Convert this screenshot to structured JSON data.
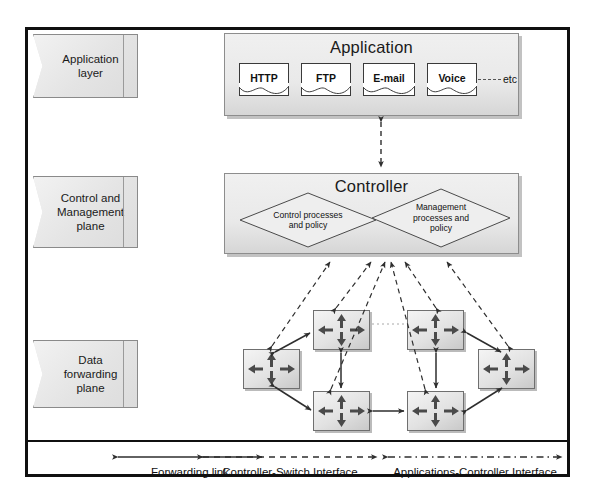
{
  "diagram": {
    "type": "layered-network-architecture"
  },
  "layers": [
    {
      "id": "application-layer",
      "label": "Application\nlayer"
    },
    {
      "id": "control-management-plane",
      "label": "Control and\nManagement\nplane"
    },
    {
      "id": "data-forwarding-plane",
      "label": "Data\nforwarding\nplane"
    }
  ],
  "application_panel": {
    "title": "Application",
    "items": [
      {
        "label": "HTTP"
      },
      {
        "label": "FTP"
      },
      {
        "label": "E-mail"
      },
      {
        "label": "Voice"
      }
    ],
    "etc_label": "etc"
  },
  "controller_panel": {
    "title": "Controller",
    "processes": [
      {
        "id": "control-processes",
        "label": "Control processes\nand policy"
      },
      {
        "id": "management-processes",
        "label": "Management\nprocesses and\npolicy"
      }
    ]
  },
  "data_plane": {
    "node_label": "switch",
    "node_count": 6,
    "nodes": [
      {
        "id": "switch-left",
        "x": 243,
        "y": 349,
        "w": 57,
        "h": 40
      },
      {
        "id": "switch-top-left",
        "x": 313,
        "y": 310,
        "w": 57,
        "h": 40
      },
      {
        "id": "switch-top-right",
        "x": 407,
        "y": 310,
        "w": 57,
        "h": 40
      },
      {
        "id": "switch-right",
        "x": 478,
        "y": 349,
        "w": 57,
        "h": 40
      },
      {
        "id": "switch-bottom-left",
        "x": 313,
        "y": 391,
        "w": 57,
        "h": 40
      },
      {
        "id": "switch-bottom-right",
        "x": 407,
        "y": 391,
        "w": 57,
        "h": 40
      }
    ]
  },
  "legend": [
    {
      "id": "forwarding-link",
      "label": "Forwarding link",
      "style": "solid"
    },
    {
      "id": "controller-switch-interface",
      "label": "Controller-Switch Interface",
      "style": "dashed"
    },
    {
      "id": "applications-controller-interface",
      "label": "Applications-Controller Interface",
      "style": "dash-dot"
    }
  ],
  "colors": {
    "frame": "#101010",
    "panel_fill": "#e9e9e9",
    "panel_border": "#8d8d8d",
    "tape_fill": "#e8e8e8",
    "switch_fill": "#e4e4e4",
    "arrow": "#3a3a3a",
    "text": "#1a1a1a"
  }
}
